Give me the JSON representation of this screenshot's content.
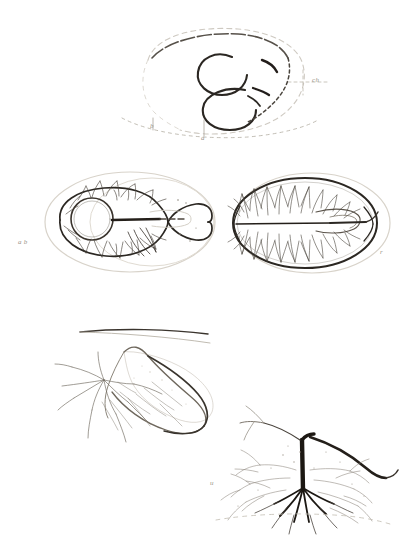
{
  "plate": {
    "title": "Anatomical engraving plate",
    "medium": "ink line engraving on aged paper",
    "background_color": "#ffffff",
    "ink_color": "#2b2722",
    "faint_ink_color": "#b9b3a8",
    "label_color": "#9a9488",
    "width": 410,
    "height": 555
  },
  "figures": [
    {
      "id": "fig-top-heart-loop",
      "name": "double-loop embryonic heart",
      "description": "Bold double curled loop with faint dashed outer ovoid envelope and construction lines",
      "position": {
        "x": 120,
        "y": 20,
        "w": 210,
        "h": 130
      },
      "labels": [
        {
          "text": "b",
          "x": 152,
          "y": 128
        },
        {
          "text": "a",
          "x": 203,
          "y": 140
        },
        {
          "text": "ch",
          "x": 314,
          "y": 82
        }
      ]
    },
    {
      "id": "fig-mid-left-ovum",
      "name": "ovum with vesicle and vascular area",
      "description": "Oval outline enclosing a circular vesicle at left with a dark stalk, surrounded by feathery vascular branching; faint outer envelope to the right",
      "position": {
        "x": 25,
        "y": 172,
        "w": 185,
        "h": 105
      },
      "labels": [
        {
          "text": "a b",
          "x": 20,
          "y": 242
        }
      ]
    },
    {
      "id": "fig-mid-right-ovum",
      "name": "ovum with central axis and radiating vessels",
      "description": "Oval outline with a horizontal central axis line and dense feather-like vessels radiating to the rim; small loop structure right of centre",
      "position": {
        "x": 228,
        "y": 172,
        "w": 165,
        "h": 105
      },
      "labels": [
        {
          "text": "r",
          "x": 382,
          "y": 254
        }
      ]
    },
    {
      "id": "fig-bottom-left-membrane",
      "name": "teardrop membrane with vessel tuft",
      "description": "Large teardrop or leaf shaped membrane with a long straight upper edge and a tuft of fine branching vessels entering from the left",
      "position": {
        "x": 62,
        "y": 322,
        "w": 160,
        "h": 118
      },
      "labels": []
    },
    {
      "id": "fig-bottom-right-trunk",
      "name": "vessel trunk with root branches",
      "description": "Thick dark vertical vascular trunk arching to the right and splaying into fine root-like branches below, with faint surrounding capillary haze",
      "position": {
        "x": 205,
        "y": 418,
        "w": 185,
        "h": 118
      },
      "labels": [
        {
          "text": "u",
          "x": 212,
          "y": 484
        }
      ]
    }
  ]
}
